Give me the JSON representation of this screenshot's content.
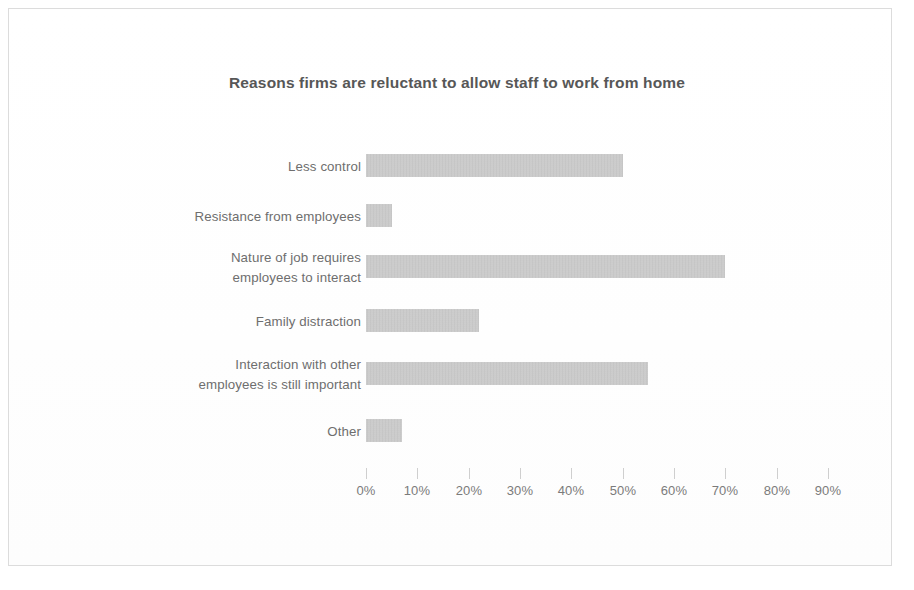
{
  "chart_data": {
    "type": "bar",
    "orientation": "horizontal",
    "title": "Reasons firms are reluctant to allow staff to work from home",
    "xlabel": "",
    "ylabel": "",
    "xlim": [
      0,
      90
    ],
    "grid": false,
    "legend": null,
    "bar_color": "#c4c4c4",
    "title_color": "#575757",
    "label_color": "#6e6e6e",
    "tick_color": "#7b7b7b",
    "categories": [
      "Less control",
      "Resistance from employees",
      "Nature of job requires\nemployees to interact",
      "Family distraction",
      "Interaction with other\nemployees is still important",
      "Other"
    ],
    "values": [
      50,
      5,
      70,
      22,
      55,
      7
    ],
    "value_labels": [
      "50%",
      "5%",
      "70%",
      "22%",
      "55%",
      "7%"
    ],
    "xticks": [
      0,
      10,
      20,
      30,
      40,
      50,
      60,
      70,
      80,
      90
    ],
    "xtick_labels": [
      "0%",
      "10%",
      "20%",
      "30%",
      "40%",
      "50%",
      "60%",
      "70%",
      "80%",
      "90%"
    ]
  }
}
